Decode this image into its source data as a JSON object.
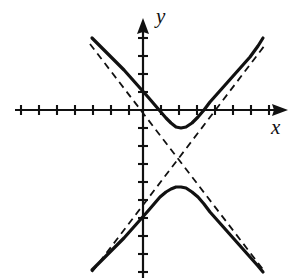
{
  "figure": {
    "width": 300,
    "height": 280,
    "background_color": "#ffffff",
    "ink_color": "#111111"
  },
  "axes": {
    "x_label": "x",
    "y_label": "y",
    "origin_px": [
      143,
      110
    ],
    "unit_px": 18,
    "x_axis_y_px": 110,
    "y_axis_x_px": 143,
    "x_axis_start_px": 15,
    "x_axis_end_px": 288,
    "y_axis_top_px": 18,
    "y_axis_bottom_px": 278,
    "tick_length_px": 9,
    "x_ticks_px": [
      21,
      39,
      57,
      75,
      93,
      111,
      129,
      161,
      179,
      197,
      215,
      233,
      251,
      269
    ],
    "y_ticks_px": [
      38,
      56,
      74,
      92,
      128,
      146,
      164,
      182,
      200,
      218,
      236,
      254,
      272
    ],
    "arrowheads": [
      "x-positive",
      "y-positive"
    ],
    "grid": false
  },
  "chart_data": {
    "type": "line",
    "xlabel": "x",
    "ylabel": "y",
    "xlim": [
      -7.1,
      8.1
    ],
    "ylim": [
      -9.3,
      5.1
    ],
    "grid": false,
    "legend": null,
    "annotations": [],
    "curve_geometry": {
      "center": [
        1.94,
        -2.67
      ],
      "a": 1.67,
      "b": 1.67,
      "orientation": "vertical-transverse",
      "asymptote_slopes": [
        1.0,
        -1.0
      ],
      "vertex_upper": [
        1.94,
        -1.0
      ],
      "vertex_lower": [
        1.94,
        -4.28
      ]
    },
    "series": [
      {
        "name": "hyperbola-upper-branch",
        "style": "solid",
        "line_width_px": 3.2,
        "color": "#111111",
        "points_px": [
          [
            92,
            38
          ],
          [
            100,
            46
          ],
          [
            108,
            54
          ],
          [
            116,
            62
          ],
          [
            124,
            70
          ],
          [
            132,
            79
          ],
          [
            140,
            88
          ],
          [
            148,
            97
          ],
          [
            154,
            104
          ],
          [
            160,
            111
          ],
          [
            166,
            118
          ],
          [
            171,
            123
          ],
          [
            176,
            127
          ],
          [
            181,
            128
          ],
          [
            186,
            127
          ],
          [
            192,
            123
          ],
          [
            198,
            117
          ],
          [
            204,
            110
          ],
          [
            210,
            102
          ],
          [
            218,
            93
          ],
          [
            226,
            84
          ],
          [
            234,
            75
          ],
          [
            242,
            66
          ],
          [
            250,
            57
          ],
          [
            258,
            46
          ],
          [
            263,
            38
          ]
        ]
      },
      {
        "name": "hyperbola-lower-branch",
        "style": "solid",
        "line_width_px": 3.2,
        "color": "#111111",
        "points_px": [
          [
            92,
            270
          ],
          [
            100,
            262
          ],
          [
            108,
            254
          ],
          [
            116,
            246
          ],
          [
            124,
            238
          ],
          [
            132,
            229
          ],
          [
            140,
            220
          ],
          [
            148,
            211
          ],
          [
            154,
            204
          ],
          [
            160,
            197
          ],
          [
            166,
            192
          ],
          [
            171,
            189
          ],
          [
            176,
            187
          ],
          [
            181,
            187
          ],
          [
            186,
            188
          ],
          [
            192,
            192
          ],
          [
            198,
            197
          ],
          [
            204,
            204
          ],
          [
            210,
            212
          ],
          [
            218,
            221
          ],
          [
            226,
            230
          ],
          [
            234,
            239
          ],
          [
            242,
            248
          ],
          [
            250,
            257
          ],
          [
            258,
            266
          ],
          [
            263,
            272
          ]
        ]
      },
      {
        "name": "asymptote-positive-slope",
        "style": "dashed",
        "line_width_px": 1.8,
        "dash_px": [
          7,
          5
        ],
        "color": "#111111",
        "points_px": [
          [
            92,
            272
          ],
          [
            265,
            45
          ]
        ]
      },
      {
        "name": "asymptote-negative-slope",
        "style": "dashed",
        "line_width_px": 1.8,
        "dash_px": [
          7,
          5
        ],
        "color": "#111111",
        "points_px": [
          [
            90,
            44
          ],
          [
            265,
            272
          ]
        ]
      }
    ]
  }
}
